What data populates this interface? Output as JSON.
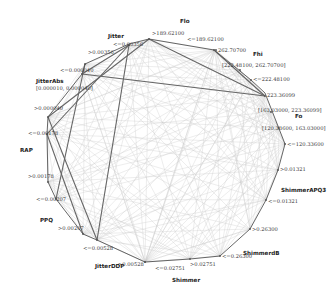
{
  "diagram": {
    "type": "circular-network",
    "colors": {
      "background": "#ffffff",
      "outline": "#555555",
      "strong_edge": "#666666",
      "weak_edge": "#c8c8c8"
    },
    "variables": [
      {
        "name": "Jitter",
        "pos": [
          108,
          38
        ],
        "values": [
          {
            "label": "<=0.00356",
            "pos": [
              113,
              46
            ],
            "node": [
              129,
              45
            ]
          },
          {
            "label": ">0.00356",
            "pos": [
              88,
              54
            ],
            "node": [
              85,
              64
            ]
          }
        ]
      },
      {
        "name": "Flo",
        "pos": [
          180,
          23
        ],
        "values": [
          {
            "label": ">189.62100",
            "pos": [
              152,
              35
            ],
            "node": [
              149,
              39
            ]
          },
          {
            "label": "<=189.62100",
            "pos": [
              187,
              41
            ],
            "node": [
              214,
              50
            ]
          }
        ]
      },
      {
        "name": "Fhi",
        "pos": [
          253,
          56
        ],
        "values": [
          {
            "label": "262.70700",
            "pos": [
              218,
              52
            ],
            "node": [
              216,
              50
            ]
          },
          {
            "label": "[222.48100, 262.70700]",
            "pos": [
              222,
              67
            ],
            "node": [
              240,
              70
            ]
          },
          {
            "label": "<=222.48100",
            "pos": [
              253,
              81
            ],
            "node": [
              251,
              80
            ]
          }
        ]
      },
      {
        "name": "Fo",
        "pos": [
          295,
          118
        ],
        "values": [
          {
            "label": "223.36099",
            "pos": [
              267,
              97
            ],
            "node": [
              265,
              96
            ]
          },
          {
            "label": "[163.03000, 223.36099]",
            "pos": [
              258,
              112
            ],
            "node": [
              271,
              112
            ]
          },
          {
            "label": "[120.33600, 163.03000]",
            "pos": [
              262,
              130
            ],
            "node": [
              279,
              128
            ]
          },
          {
            "label": "<=120.33600",
            "pos": [
              287,
              146
            ],
            "node": [
              285,
              144
            ]
          }
        ]
      },
      {
        "name": "ShimmerAPQ3",
        "pos": [
          281,
          192
        ],
        "values": [
          {
            "label": ">0.01321",
            "pos": [
              280,
              171
            ],
            "node": [
              278,
              170
            ]
          },
          {
            "label": "<=0.01321",
            "pos": [
              268,
              203
            ],
            "node": [
              266,
              200
            ]
          }
        ]
      },
      {
        "name": "ShimmerdB",
        "pos": [
          243,
          255
        ],
        "values": [
          {
            "label": ">0.26300",
            "pos": [
              252,
              231
            ],
            "node": [
              250,
              229
            ]
          },
          {
            "label": "<=0.26300",
            "pos": [
              222,
              258
            ],
            "node": [
              220,
              256
            ]
          }
        ]
      },
      {
        "name": "Shimmer",
        "pos": [
          172,
          282
        ],
        "values": [
          {
            "label": ">0.02751",
            "pos": [
              190,
              266
            ],
            "node": [
              190,
              259
            ]
          },
          {
            "label": "<=0.02751",
            "pos": [
              155,
              270
            ],
            "node": [
              145,
              262
            ]
          }
        ]
      },
      {
        "name": "JitterDDP",
        "pos": [
          95,
          268
        ],
        "values": [
          {
            "label": ">0.00528",
            "pos": [
              118,
              266
            ],
            "node": [
              145,
              262
            ]
          },
          {
            "label": "<=0.00528",
            "pos": [
              83,
              250
            ],
            "node": [
              97,
              240
            ]
          }
        ]
      },
      {
        "name": "PPQ",
        "pos": [
          40,
          222
        ],
        "values": [
          {
            "label": ">0.00207",
            "pos": [
              58,
              230
            ],
            "node": [
              83,
              234
            ]
          },
          {
            "label": "<=0.00207",
            "pos": [
              36,
              201
            ],
            "node": [
              56,
              199
            ]
          }
        ]
      },
      {
        "name": "RAP",
        "pos": [
          20,
          152
        ],
        "values": [
          {
            "label": ">0.00178",
            "pos": [
              28,
              178
            ],
            "node": [
              48,
              182
            ]
          },
          {
            "label": "<=0.00178",
            "pos": [
              28,
              135
            ],
            "node": [
              47,
              134
            ]
          }
        ]
      },
      {
        "name": "JitterAbs",
        "pos": [
          36,
          83
        ],
        "sub": "[0.000010, 0.000040]",
        "values": [
          {
            "label": ">0.000040",
            "pos": [
              34,
              110
            ],
            "node": [
              48,
              117
            ]
          },
          {
            "label": "<=0.000040",
            "pos": [
              60,
              72
            ],
            "node": [
              82,
              74
            ]
          }
        ]
      }
    ],
    "outline": [
      [
        85,
        64
      ],
      [
        129,
        44
      ],
      [
        149,
        39
      ],
      [
        214,
        50
      ],
      [
        251,
        80
      ],
      [
        265,
        93
      ],
      [
        285,
        144
      ],
      [
        278,
        170
      ],
      [
        266,
        200
      ],
      [
        250,
        229
      ],
      [
        220,
        256
      ],
      [
        190,
        259
      ],
      [
        145,
        262
      ],
      [
        97,
        240
      ],
      [
        83,
        234
      ],
      [
        56,
        199
      ],
      [
        48,
        182
      ],
      [
        47,
        134
      ],
      [
        48,
        117
      ],
      [
        82,
        74
      ]
    ],
    "strong_edges": [
      [
        [
          129,
          45
        ],
        [
          47,
          134
        ]
      ],
      [
        [
          129,
          45
        ],
        [
          97,
          240
        ]
      ],
      [
        [
          149,
          39
        ],
        [
          265,
          96
        ]
      ],
      [
        [
          82,
          74
        ],
        [
          265,
          96
        ]
      ],
      [
        [
          85,
          64
        ],
        [
          56,
          199
        ]
      ],
      [
        [
          48,
          117
        ],
        [
          97,
          240
        ]
      ],
      [
        [
          47,
          134
        ],
        [
          83,
          234
        ]
      ],
      [
        [
          149,
          39
        ],
        [
          48,
          117
        ]
      ],
      [
        [
          214,
          50
        ],
        [
          265,
          96
        ]
      ],
      [
        [
          129,
          45
        ],
        [
          82,
          74
        ]
      ]
    ]
  }
}
